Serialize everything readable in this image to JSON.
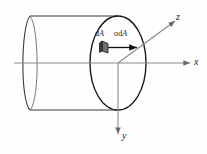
{
  "figure": {
    "type": "3d-cylinder-stress-diagram",
    "background_color": "#fefefe",
    "axes": {
      "x": {
        "label": "x",
        "direction": "right",
        "color": "#8a8a8a",
        "arrow": true
      },
      "y": {
        "label": "y",
        "direction": "down",
        "color": "#8a8a8a",
        "arrow": true
      },
      "z": {
        "label": "z",
        "direction": "up-right",
        "color": "#8a8a8a",
        "arrow": true
      },
      "origin_label": ""
    },
    "annotations": {
      "area_element": {
        "label_roman": "d",
        "label_italic": "A",
        "full_label": "dA",
        "fill_color": "#6f6f6f",
        "stroke_color": "#1a1a1a"
      },
      "force_vector": {
        "label_symbol": "σ",
        "label_roman": "d",
        "label_italic": "A",
        "full_label": "σdA",
        "arrow_color": "#111111",
        "direction": "right-along-x"
      }
    },
    "cylinder": {
      "outline_color": "#3a3a3a",
      "front_face_color": "#1a1a1a",
      "hidden_edge_color": "#6a6a6a",
      "fill": "none"
    }
  }
}
